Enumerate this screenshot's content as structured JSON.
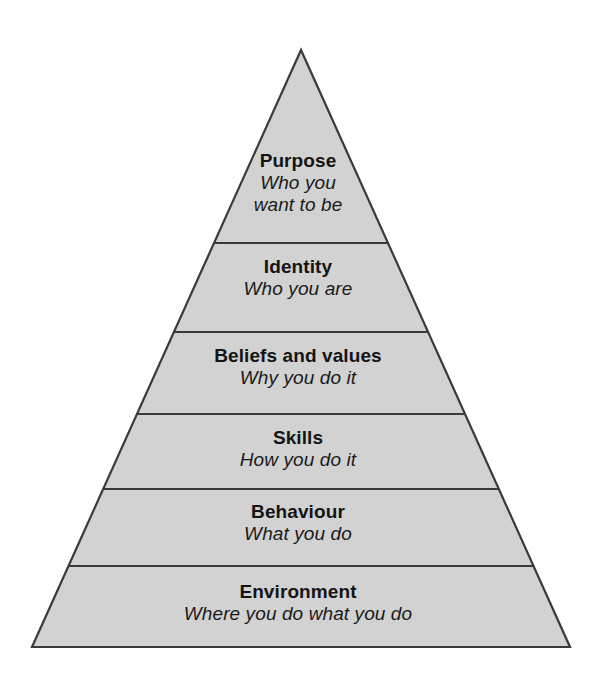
{
  "diagram": {
    "type": "pyramid",
    "name": "neurological-levels-pyramid",
    "levels_count": 6,
    "colors": {
      "fill": "#d2d2d2",
      "stroke": "#3a3a3a",
      "text": "#141414",
      "background": "#ffffff"
    },
    "geometry": {
      "apex_x": 301,
      "apex_y": 50,
      "base_left_x": 32,
      "base_right_x": 570,
      "base_y": 647,
      "divider_y": [
        243,
        332,
        414,
        489,
        566
      ]
    },
    "levels": [
      {
        "index": 1,
        "title": "Purpose",
        "subtitle": "Who you\nwant to be"
      },
      {
        "index": 2,
        "title": "Identity",
        "subtitle": "Who you are"
      },
      {
        "index": 3,
        "title": "Beliefs and values",
        "subtitle": "Why you do it"
      },
      {
        "index": 4,
        "title": "Skills",
        "subtitle": "How you do it"
      },
      {
        "index": 5,
        "title": "Behaviour",
        "subtitle": "What you do"
      },
      {
        "index": 6,
        "title": "Environment",
        "subtitle": "Where you do what you do"
      }
    ]
  }
}
